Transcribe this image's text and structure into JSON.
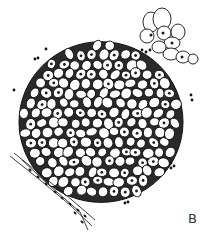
{
  "figure": {
    "panel_label": "B",
    "colors": {
      "background": "#ffffff",
      "ink": "#111111",
      "cell_fill": "#ffffff",
      "nucleus": "#1a1a1a",
      "label": "#333333"
    },
    "main_cluster": {
      "center": [
        101,
        122
      ],
      "radius": 82,
      "cell_count_approx": 180
    },
    "small_cluster": {
      "cells": [
        [
          151,
          22,
          8,
          10
        ],
        [
          162,
          19,
          9,
          11
        ],
        [
          147,
          36,
          7,
          7
        ],
        [
          164,
          33,
          7,
          7
        ],
        [
          178,
          32,
          7,
          8
        ],
        [
          172,
          43,
          8,
          6
        ],
        [
          159,
          47,
          7,
          6
        ],
        [
          171,
          54,
          8,
          6
        ],
        [
          183,
          57,
          7,
          6
        ],
        [
          193,
          59,
          5,
          5
        ]
      ],
      "nuclei": [
        [
          151,
          35
        ],
        [
          163,
          33
        ],
        [
          172,
          43
        ],
        [
          182,
          57
        ]
      ]
    },
    "granules": [
      [
        46,
        49
      ],
      [
        35,
        59
      ],
      [
        38,
        58
      ],
      [
        14,
        90
      ],
      [
        142,
        50
      ],
      [
        146,
        52
      ],
      [
        150,
        50
      ],
      [
        191,
        95
      ],
      [
        192,
        100
      ],
      [
        171,
        163
      ],
      [
        174,
        166
      ],
      [
        171,
        168
      ],
      [
        125,
        203
      ],
      [
        128,
        202
      ]
    ],
    "fiber_strand": {
      "lines": [
        [
          [
            10,
            156
          ],
          [
            40,
            180
          ],
          [
            70,
            205
          ],
          [
            92,
            226
          ]
        ],
        [
          [
            14,
            153
          ],
          [
            45,
            178
          ],
          [
            72,
            200
          ],
          [
            95,
            220
          ]
        ],
        [
          [
            22,
            160
          ],
          [
            50,
            186
          ],
          [
            80,
            212
          ],
          [
            88,
            230
          ]
        ]
      ],
      "dots": [
        [
          30,
          170
        ],
        [
          38,
          177
        ],
        [
          46,
          184
        ],
        [
          55,
          192
        ],
        [
          62,
          198
        ],
        [
          70,
          204
        ],
        [
          78,
          210
        ],
        [
          85,
          216
        ],
        [
          75,
          213
        ],
        [
          82,
          222
        ]
      ]
    }
  }
}
